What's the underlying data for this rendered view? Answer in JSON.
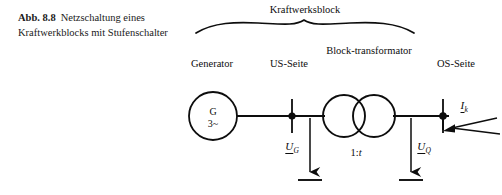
{
  "caption": {
    "figure_number": "Abb. 8.8",
    "text": "Netzschaltung eines Kraftwerkblocks mit Stufenschalter"
  },
  "diagram": {
    "brace_label": "Kraftwerksblock",
    "labels": {
      "generator": "Generator",
      "us_side": "US-Seite",
      "block_transformer": "Block-transformator",
      "os_side": "OS-Seite"
    },
    "generator_symbol": {
      "machine": "G",
      "phases": "3~"
    },
    "transformer_ratio_prefix": "1:",
    "transformer_ratio_variable": "t",
    "voltage_generator": {
      "symbol": "U",
      "subscript": "G"
    },
    "voltage_network": {
      "symbol": "U",
      "subscript": "Q"
    },
    "current_short_circuit": {
      "symbol": "I",
      "subscript": "k"
    },
    "colors": {
      "line": "#0d0d0d",
      "background": "#ffffff"
    }
  }
}
